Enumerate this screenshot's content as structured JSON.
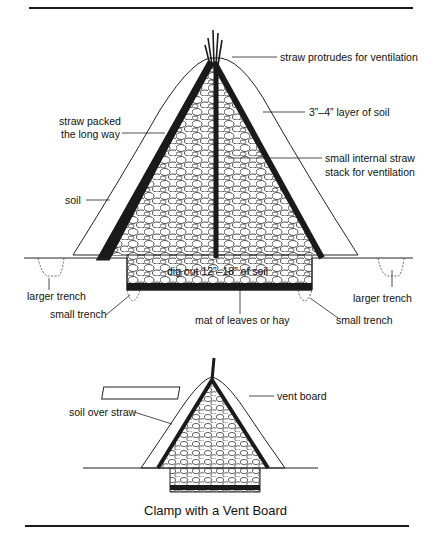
{
  "diagram": {
    "main": {
      "labels": {
        "straw_protrudes": "straw protrudes for ventilation",
        "soil_layer": "3”–4” layer of soil",
        "straw_packed_1": "straw packed",
        "straw_packed_2": "the long way",
        "internal_stack_1": "small internal straw",
        "internal_stack_2": "stack for ventilation",
        "soil": "soil",
        "dig_out": "dig out 12”–18” of soil",
        "larger_trench_left": "larger trench",
        "larger_trench_right": "larger trench",
        "small_trench_left": "small trench",
        "small_trench_right": "small trench",
        "mat": "mat of leaves or hay"
      }
    },
    "inset": {
      "labels": {
        "vent_board": "vent board",
        "soil_over_straw": "soil over straw"
      },
      "caption": "Clamp with a Vent Board"
    }
  }
}
